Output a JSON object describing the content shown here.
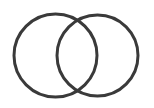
{
  "figure": {
    "canvas": {
      "width": 154,
      "height": 108,
      "background_color": "#ffffff"
    },
    "style": {
      "stroke_color": "#3a3a3a",
      "stroke_width": 3,
      "fill": "none"
    },
    "shapes": [
      {
        "name": "left-circle",
        "type": "circle",
        "cx": 55.5,
        "cy": 55.5,
        "r": 41.5,
        "label": ""
      },
      {
        "name": "right-circle",
        "type": "circle",
        "cx": 97.5,
        "cy": 55.5,
        "r": 40.5,
        "label": ""
      }
    ],
    "intersections": [
      {
        "name": "upper-crossing-point",
        "x": 77,
        "y": 18
      },
      {
        "name": "lower-crossing-point",
        "x": 77,
        "y": 89
      }
    ],
    "regions": [
      {
        "name": "left-only-region",
        "label": ""
      },
      {
        "name": "overlap-region",
        "label": ""
      },
      {
        "name": "right-only-region",
        "label": ""
      }
    ]
  }
}
